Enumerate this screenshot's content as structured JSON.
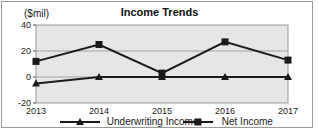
{
  "chart_data": {
    "type": "line",
    "title": "Income Trends",
    "ylabel": "($mil)",
    "xlabel": "",
    "categories": [
      "2013",
      "2014",
      "2015",
      "2016",
      "2017"
    ],
    "series": [
      {
        "name": "Underwriting Income",
        "marker": "triangle",
        "values": [
          -5,
          0,
          0,
          0,
          0
        ]
      },
      {
        "name": "Net Income",
        "marker": "square",
        "values": [
          12,
          25,
          3,
          27,
          13
        ]
      }
    ],
    "ylim": [
      -20,
      40
    ],
    "yticks": [
      -20,
      0,
      20,
      40
    ],
    "grid": true,
    "legend_position": "bottom",
    "colors": {
      "plot_bg": "#e6e6e6",
      "line": "#1a1a1a",
      "grid": "#a0a0a0"
    }
  },
  "legend": {
    "underwriting": "Underwriting Income",
    "net": "Net Income"
  }
}
